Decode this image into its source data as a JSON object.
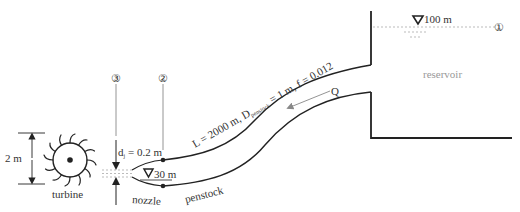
{
  "diagram": {
    "stations": {
      "station_1": "①",
      "station_2": "②",
      "station_3": "③"
    },
    "reservoir": {
      "label": "reservoir",
      "water_level": "100 m"
    },
    "penstock": {
      "label": "penstock",
      "spec_prefix": "L = 2000 m, D",
      "spec_sub": "penstock",
      "spec_suffix": " = 1 m, f = 0.012",
      "flow_label": "Q"
    },
    "nozzle": {
      "label": "nozzle",
      "elevation": "30 m",
      "jet_diameter_prefix": "d",
      "jet_diameter_sub": "j",
      "jet_diameter_suffix": " = 0.2 m"
    },
    "turbine": {
      "label": "turbine",
      "diameter": "2 m"
    },
    "colors": {
      "line": "#222222",
      "guide": "#888888",
      "dashed": "#aaaaaa"
    }
  }
}
